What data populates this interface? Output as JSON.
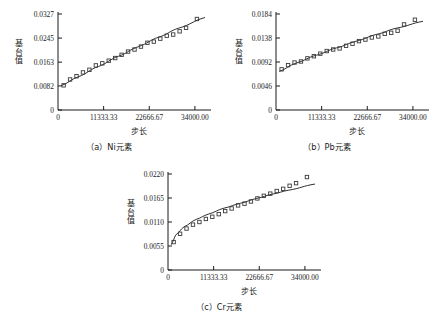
{
  "figure": {
    "background": "#ffffff",
    "marker_color": "#3a3a3a",
    "line_color": "#1a1a1a"
  },
  "chart_data": [
    {
      "type": "scatter",
      "id": "ni",
      "title": "（a）Ni元素",
      "xlabel": "步长",
      "ylabel": "基台值",
      "ylabel_chars": [
        "基",
        "台",
        "值"
      ],
      "xlim": [
        0,
        37000
      ],
      "ylim": [
        0,
        0.0327
      ],
      "xticks": [
        0,
        11333.33,
        22666.67,
        34000.0
      ],
      "xtick_labels": [
        "0",
        "11333.33",
        "22666.67",
        "34000.00"
      ],
      "yticks": [
        0,
        0.0082,
        0.0163,
        0.0245,
        0.0327
      ],
      "ytick_labels": [
        "0",
        "0.0082",
        "0.0163",
        "0.0245",
        "0.0327"
      ],
      "grid": false,
      "legend": "none",
      "x": [
        1400,
        3000,
        4600,
        6200,
        7800,
        9400,
        11000,
        12600,
        14200,
        15800,
        17400,
        19000,
        20600,
        22200,
        23800,
        25400,
        27000,
        28600,
        30200,
        31800,
        34500
      ],
      "y": [
        0.0084,
        0.0104,
        0.0115,
        0.0128,
        0.0137,
        0.0152,
        0.0159,
        0.0168,
        0.0177,
        0.0188,
        0.0199,
        0.0206,
        0.0216,
        0.0229,
        0.0233,
        0.0243,
        0.0253,
        0.0257,
        0.0268,
        0.028,
        0.031
      ],
      "fit_curve": {
        "kind": "near-linear-concave",
        "x": [
          800,
          5000,
          10000,
          15000,
          20000,
          25000,
          30000,
          36500
        ],
        "y": [
          0.0083,
          0.0113,
          0.0148,
          0.0183,
          0.0216,
          0.0248,
          0.0279,
          0.0315
        ]
      }
    },
    {
      "type": "scatter",
      "id": "pb",
      "title": "（b）Pb元素",
      "xlabel": "步长",
      "ylabel": "基台值",
      "ylabel_chars": [
        "基",
        "台",
        "值"
      ],
      "xlim": [
        0,
        37000
      ],
      "ylim": [
        0,
        0.0184
      ],
      "xticks": [
        0,
        11333.33,
        22666.67,
        34000.0
      ],
      "xtick_labels": [
        "0",
        "11333.33",
        "22666.67",
        "34000.00"
      ],
      "yticks": [
        0,
        0.0046,
        0.0092,
        0.0138,
        0.0184
      ],
      "ytick_labels": [
        "0",
        "0.0046",
        "0.0092",
        "0.0138",
        "0.0184"
      ],
      "grid": false,
      "legend": "none",
      "x": [
        1400,
        3000,
        4600,
        6200,
        7800,
        9400,
        11000,
        12600,
        14200,
        15800,
        17400,
        19000,
        20600,
        22200,
        23800,
        25400,
        27000,
        28600,
        30200,
        31800,
        34500
      ],
      "y": [
        0.0078,
        0.0086,
        0.0091,
        0.0093,
        0.0099,
        0.0103,
        0.0108,
        0.0113,
        0.0116,
        0.0118,
        0.0123,
        0.0127,
        0.0132,
        0.0135,
        0.0139,
        0.0141,
        0.0146,
        0.0148,
        0.0152,
        0.0164,
        0.0173
      ],
      "fit_curve": {
        "kind": "near-linear-concave",
        "x": [
          800,
          5000,
          10000,
          15000,
          20000,
          25000,
          30000,
          36500
        ],
        "y": [
          0.0074,
          0.009,
          0.0105,
          0.0119,
          0.0132,
          0.0145,
          0.0157,
          0.017
        ]
      }
    },
    {
      "type": "scatter",
      "id": "cr",
      "title": "（c）Cr元素",
      "xlabel": "步长",
      "ylabel": "基台值",
      "ylabel_chars": [
        "基",
        "台",
        "值"
      ],
      "xlim": [
        0,
        37000
      ],
      "ylim": [
        0,
        0.022
      ],
      "xticks": [
        0,
        11333.33,
        22666.67,
        34000.0
      ],
      "xtick_labels": [
        "0",
        "11333.33",
        "22666.67",
        "34000.00"
      ],
      "yticks": [
        0,
        0.0055,
        0.011,
        0.0165,
        0.022
      ],
      "ytick_labels": [
        "0",
        "0.0055",
        "0.0110",
        "0.0165",
        "0.0220"
      ],
      "grid": false,
      "legend": "none",
      "x": [
        1400,
        3000,
        4600,
        6200,
        7800,
        9400,
        11000,
        12600,
        14200,
        15800,
        17400,
        19000,
        20600,
        22200,
        23800,
        25400,
        27000,
        28600,
        30200,
        31800,
        34500
      ],
      "y": [
        0.0064,
        0.0083,
        0.0095,
        0.0104,
        0.011,
        0.0117,
        0.0122,
        0.0128,
        0.0135,
        0.0141,
        0.0148,
        0.0152,
        0.0157,
        0.0164,
        0.017,
        0.0175,
        0.0181,
        0.0186,
        0.0193,
        0.0199,
        0.0213
      ],
      "fit_curve": {
        "kind": "logarithmic-concave",
        "x": [
          800,
          2000,
          4000,
          7000,
          10000,
          14000,
          18000,
          22000,
          26000,
          30000,
          36500
        ],
        "y": [
          0.0058,
          0.0081,
          0.0099,
          0.0116,
          0.0128,
          0.0142,
          0.0153,
          0.0164,
          0.0174,
          0.0183,
          0.0197
        ]
      }
    }
  ]
}
